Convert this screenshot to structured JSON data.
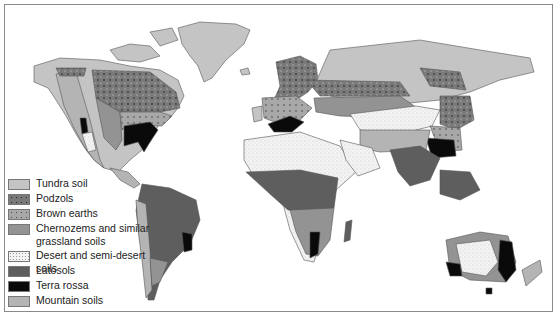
{
  "map": {
    "title": "World soil types",
    "legend": {
      "items": [
        {
          "label": "Tundra soil",
          "color": "#c4c4c4",
          "pattern": "solid"
        },
        {
          "label": "Podzols",
          "color": "#7a7a7a",
          "pattern": "dots-dark"
        },
        {
          "label": "Brown earths",
          "color": "#a8a8a8",
          "pattern": "dots"
        },
        {
          "label": "Chernozems and similar grassland soils",
          "color": "#939393",
          "pattern": "solid"
        },
        {
          "label": "Desert and semi-desert soils",
          "color": "#f2f2f2",
          "pattern": "stipple"
        },
        {
          "label": "Latosols",
          "color": "#5e5e5e",
          "pattern": "solid"
        },
        {
          "label": "Terra rossa",
          "color": "#0a0a0a",
          "pattern": "solid"
        },
        {
          "label": "Mountain soils",
          "color": "#b4b4b4",
          "pattern": "solid"
        }
      ]
    },
    "colors": {
      "ocean": "#ffffff",
      "border": "#8a8a8a",
      "coast": "#555555"
    }
  }
}
